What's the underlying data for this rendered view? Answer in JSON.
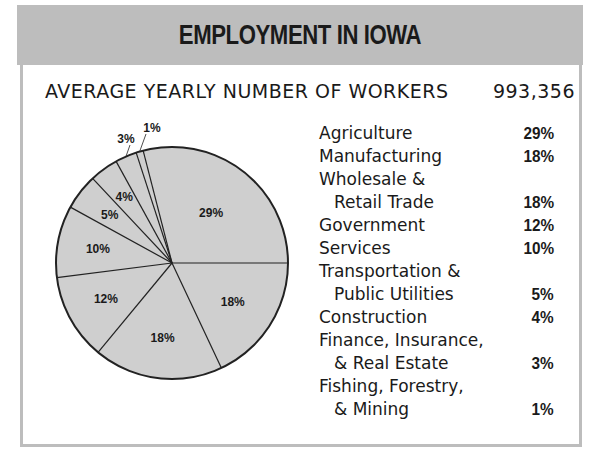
{
  "title": "EMPLOYMENT IN IOWA",
  "subtitle": {
    "label": "AVERAGE YEARLY NUMBER OF WORKERS",
    "value": "993,356"
  },
  "colors": {
    "header_band": "#bdbdbd",
    "pie_fill": "#cfcfcf",
    "pie_stroke": "#222222",
    "frame": "#bdbdbd"
  },
  "legend": [
    {
      "lines": [
        "Agriculture"
      ],
      "value": "29%"
    },
    {
      "lines": [
        "Manufacturing"
      ],
      "value": "18%"
    },
    {
      "lines": [
        "Wholesale &",
        "Retail Trade"
      ],
      "value": "18%"
    },
    {
      "lines": [
        "Government"
      ],
      "value": "12%"
    },
    {
      "lines": [
        "Services"
      ],
      "value": "10%"
    },
    {
      "lines": [
        "Transportation &",
        "Public Utilities"
      ],
      "value": "5%"
    },
    {
      "lines": [
        "Construction"
      ],
      "value": "4%"
    },
    {
      "lines": [
        "Finance, Insurance,",
        "& Real Estate"
      ],
      "value": "3%"
    },
    {
      "lines": [
        "Fishing, Forestry,",
        "& Mining"
      ],
      "value": "1%"
    }
  ],
  "chart_data": {
    "type": "pie",
    "title": "EMPLOYMENT IN IOWA",
    "subtitle": "AVERAGE YEARLY NUMBER OF WORKERS 993,356",
    "categories": [
      "Agriculture",
      "Manufacturing",
      "Wholesale & Retail Trade",
      "Government",
      "Services",
      "Transportation & Public Utilities",
      "Construction",
      "Finance, Insurance, & Real Estate",
      "Fishing, Forestry, & Mining"
    ],
    "values": [
      29,
      18,
      18,
      12,
      10,
      5,
      4,
      3,
      1
    ],
    "labels": [
      "29%",
      "18%",
      "18%",
      "12%",
      "10%",
      "5%",
      "4%",
      "3%",
      "1%"
    ],
    "unit": "%",
    "legend_position": "right",
    "total_workers": 993356
  }
}
